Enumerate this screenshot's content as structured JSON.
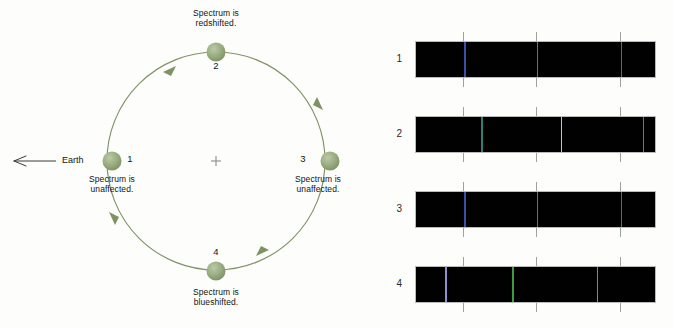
{
  "figure": {
    "type": "diagram",
    "background_color": "#fdfdfb"
  },
  "orbit": {
    "center_marker": "+",
    "center_x": 216,
    "center_y": 161,
    "radius": 109,
    "stroke_color": "#7f9264",
    "sphere_color": "#93a878",
    "direction": "counterclockwise-as-drawn",
    "earth_arrow": {
      "label": "Earth",
      "direction": "left",
      "arrow_glyph": "left-arrow"
    },
    "positions": [
      {
        "number": "1",
        "x": 112,
        "y": 161,
        "caption": "Spectrum is\nunaffected.",
        "caption_x": 112,
        "caption_y": 176,
        "num_x": 130,
        "num_y": 154,
        "shift": "none"
      },
      {
        "number": "2",
        "x": 216,
        "y": 52,
        "caption": "Spectrum is\nredshifted.",
        "caption_x": 216,
        "caption_y": 8,
        "num_x": 216,
        "num_y": 62,
        "shift": "redshift"
      },
      {
        "number": "3",
        "x": 330,
        "y": 161,
        "caption": "Spectrum is\nunaffected.",
        "caption_x": 316,
        "caption_y": 176,
        "num_x": 302,
        "num_y": 154,
        "shift": "none"
      },
      {
        "number": "4",
        "x": 216,
        "y": 271,
        "caption": "Spectrum is\nblueshifted.",
        "caption_x": 216,
        "caption_y": 281,
        "num_x": 216,
        "num_y": 248,
        "shift": "blueshift"
      }
    ]
  },
  "spectra": {
    "band_left": 415,
    "band_width": 241,
    "band_height": 37,
    "label_x": 388,
    "tick_positions_pct": [
      20,
      50,
      85
    ],
    "tick_color": "#9ea29c",
    "rows": [
      {
        "label": "1",
        "top": 41,
        "shift_note": "unshifted",
        "lines": [
          {
            "pos_pct": 20,
            "color": "#3a4fa8"
          },
          {
            "pos_pct": 50,
            "color": "#3f8f3a"
          },
          {
            "pos_pct": 85,
            "color": "#c6461f"
          }
        ]
      },
      {
        "label": "2",
        "top": 116,
        "shift_note": "redshifted",
        "lines": [
          {
            "pos_pct": 27,
            "color": "#2e7f78"
          },
          {
            "pos_pct": 60,
            "color": "#d6d447"
          },
          {
            "pos_pct": 94,
            "color": "#d2502a"
          }
        ]
      },
      {
        "label": "3",
        "top": 191,
        "shift_note": "unshifted",
        "lines": [
          {
            "pos_pct": 20,
            "color": "#3a4fa8"
          },
          {
            "pos_pct": 50,
            "color": "#3f8f3a"
          },
          {
            "pos_pct": 85,
            "color": "#c6461f"
          }
        ]
      },
      {
        "label": "4",
        "top": 266,
        "shift_note": "blueshifted",
        "lines": [
          {
            "pos_pct": 12,
            "color": "#8f8fd0"
          },
          {
            "pos_pct": 40,
            "color": "#3f9b3f"
          },
          {
            "pos_pct": 75,
            "color": "#d2722a"
          }
        ]
      }
    ]
  }
}
